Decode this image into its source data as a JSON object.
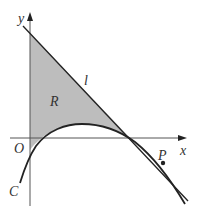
{
  "diagram": {
    "labels": {
      "y_axis": "y",
      "x_axis": "x",
      "origin": "O",
      "line": "l",
      "region": "R",
      "point": "P",
      "curve": "C"
    },
    "colors": {
      "region_fill": "#bdbdbd",
      "stroke": "#222222",
      "axis": "#555555"
    }
  }
}
